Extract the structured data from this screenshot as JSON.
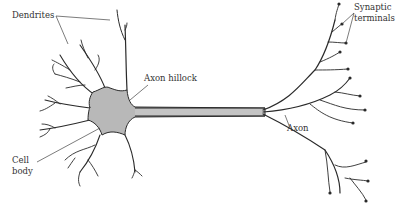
{
  "diagram": {
    "colors": {
      "cell_fill": "#b8b8b8",
      "outline": "#2a2a2a",
      "label_text": "#333333",
      "background": "#ffffff"
    },
    "labels": {
      "dendrites": "Dendrites",
      "axon_hillock": "Axon hillock",
      "synaptic_line1": "Synaptic",
      "synaptic_line2": "terminals",
      "axon": "Axon",
      "cell_line1": "Cell",
      "cell_line2": "body"
    }
  }
}
